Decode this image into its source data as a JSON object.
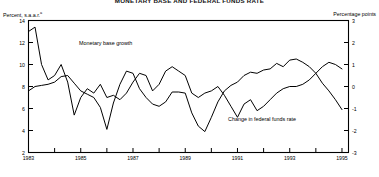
{
  "figure": {
    "title": "MONETARY BASE AND FEDERAL FUNDS RATE",
    "left_axis_label": "Percent, s.a.a.r.",
    "left_axis_superscript": "a",
    "right_axis_label": "Percentage points",
    "series_label_monetary_base": "Monetary base growth",
    "series_label_fed_funds": "Change in federal funds rate"
  },
  "chart_data": {
    "type": "line",
    "title": "MONETARY BASE AND FEDERAL FUNDS RATE",
    "xlabel": "",
    "ylabel": "Percent, s.a.a.r.",
    "y2label": "Percentage points",
    "xlim": [
      1983.0,
      1995.25
    ],
    "ylim": [
      2,
      14
    ],
    "y2lim": [
      -3,
      3
    ],
    "grid": false,
    "legend": "inline-annotation",
    "yticks": [
      2,
      4,
      6,
      8,
      10,
      12,
      14
    ],
    "y2ticks": [
      -3,
      -2,
      -1,
      0,
      1,
      2,
      3
    ],
    "xticks": [
      1983,
      1984,
      1985,
      1986,
      1987,
      1988,
      1989,
      1990,
      1991,
      1992,
      1993,
      1994,
      1995
    ],
    "xticklabels": [
      "1983",
      "",
      "1985",
      "",
      "1987",
      "",
      "1989",
      "",
      "1991",
      "",
      "1993",
      "",
      "1995"
    ],
    "series": [
      {
        "name": "Monetary base growth",
        "axis": "left",
        "units": "Percent, s.a.a.r.",
        "x": [
          1983.0,
          1983.25,
          1983.5,
          1983.75,
          1984.0,
          1984.25,
          1984.5,
          1984.75,
          1985.0,
          1985.25,
          1985.5,
          1985.75,
          1986.0,
          1986.25,
          1986.5,
          1986.75,
          1987.0,
          1987.25,
          1987.5,
          1987.75,
          1988.0,
          1988.25,
          1988.5,
          1988.75,
          1989.0,
          1989.25,
          1989.5,
          1989.75,
          1990.0,
          1990.25,
          1990.5,
          1990.75,
          1991.0,
          1991.25,
          1991.5,
          1991.75,
          1992.0,
          1992.25,
          1992.5,
          1992.75,
          1993.0,
          1993.25,
          1993.5,
          1993.75,
          1994.0,
          1994.25,
          1994.5,
          1994.75,
          1995.0
        ],
        "y": [
          7.6,
          8.0,
          8.1,
          8.2,
          8.4,
          8.9,
          9.0,
          8.3,
          7.6,
          7.3,
          7.0,
          6.1,
          4.1,
          6.5,
          8.2,
          9.4,
          9.2,
          7.8,
          7.0,
          6.4,
          6.2,
          6.6,
          7.5,
          7.5,
          7.4,
          5.6,
          4.4,
          3.9,
          5.2,
          6.6,
          7.6,
          8.1,
          8.4,
          9.0,
          9.3,
          9.2,
          9.5,
          9.6,
          10.1,
          9.8,
          10.4,
          10.5,
          10.2,
          9.8,
          9.2,
          8.3,
          7.6,
          6.8,
          5.9
        ]
      },
      {
        "name": "Change in federal funds rate",
        "axis": "right",
        "units": "Percentage points",
        "x": [
          1983.0,
          1983.25,
          1983.5,
          1983.75,
          1984.0,
          1984.25,
          1984.5,
          1984.75,
          1985.0,
          1985.25,
          1985.5,
          1985.75,
          1986.0,
          1986.25,
          1986.5,
          1986.75,
          1987.0,
          1987.25,
          1987.5,
          1987.75,
          1988.0,
          1988.25,
          1988.5,
          1988.75,
          1989.0,
          1989.25,
          1989.5,
          1989.75,
          1990.0,
          1990.25,
          1990.5,
          1990.75,
          1991.0,
          1991.25,
          1991.5,
          1991.75,
          1992.0,
          1992.25,
          1992.5,
          1992.75,
          1993.0,
          1993.25,
          1993.5,
          1993.75,
          1994.0,
          1994.25,
          1994.5,
          1994.75,
          1995.0
        ],
        "y": [
          2.5,
          2.7,
          1.0,
          0.3,
          0.5,
          1.0,
          0.2,
          -1.3,
          -0.5,
          -0.1,
          -0.3,
          0.1,
          -0.5,
          -0.4,
          -0.6,
          -0.3,
          0.2,
          0.6,
          0.5,
          -0.2,
          0.1,
          0.7,
          0.9,
          0.7,
          0.5,
          -0.3,
          -0.5,
          -0.3,
          -0.2,
          0.0,
          -0.4,
          -0.9,
          -1.4,
          -0.8,
          -0.6,
          -1.1,
          -0.9,
          -0.6,
          -0.3,
          -0.1,
          0.0,
          0.0,
          0.1,
          0.3,
          0.6,
          0.9,
          1.1,
          1.0,
          0.8
        ]
      }
    ]
  },
  "axes_text": {
    "y_ticklabels": [
      "14",
      "12",
      "10",
      "8",
      "6",
      "4",
      "2"
    ],
    "y2_ticklabels": [
      "3",
      "2",
      "1",
      "0",
      "-1",
      "-2",
      "-3"
    ],
    "x_ticklabels": [
      "1983",
      "1985",
      "1987",
      "1989",
      "1991",
      "1993",
      "1995"
    ]
  }
}
